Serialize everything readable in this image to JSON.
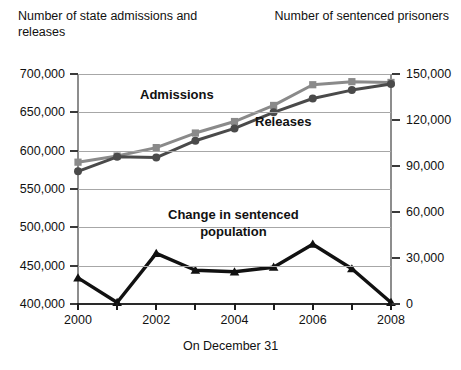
{
  "titles": {
    "left_axis": "Number of state admissions and releases",
    "right_axis": "Number of sentenced prisoners",
    "x_axis": "On December 31"
  },
  "labels": {
    "admissions": "Admissions",
    "releases": "Releases",
    "change_line1": "Change in sentenced",
    "change_line2": "population"
  },
  "colors": {
    "admissions": "#8a8a8a",
    "releases": "#4a4a4a",
    "change": "#111111",
    "gridline": "#a7a7a7",
    "axis": "#2a2a2a"
  },
  "chart_data": {
    "type": "line",
    "title": "",
    "xlabel": "On December 31",
    "ylabel": "Number of state admissions and releases",
    "y2label": "Number of sentenced prisoners",
    "x": [
      2000,
      2001,
      2002,
      2003,
      2004,
      2005,
      2006,
      2007,
      2008
    ],
    "xtick_labels": [
      "2000",
      "",
      "2002",
      "",
      "2004",
      "",
      "2006",
      "",
      "2008"
    ],
    "xlim": [
      2000,
      2008
    ],
    "ylim": [
      400000,
      700000
    ],
    "yticks": [
      400000,
      450000,
      500000,
      550000,
      600000,
      650000,
      700000
    ],
    "ytick_labels": [
      "400,000",
      "450,000",
      "500,000",
      "550,000",
      "600,000",
      "650,000",
      "700,000"
    ],
    "y2lim": [
      0,
      150000
    ],
    "y2ticks": [
      0,
      30000,
      60000,
      90000,
      120000,
      150000
    ],
    "y2tick_labels": [
      "0",
      "30,000",
      "60,000",
      "90,000",
      "120,000",
      "150,000"
    ],
    "grid": true,
    "legend": "inline-annotations",
    "series": [
      {
        "name": "Admissions",
        "axis": "left",
        "marker": "square",
        "color": "#8a8a8a",
        "values": [
          585000,
          593000,
          604000,
          623000,
          638000,
          659000,
          686000,
          690000,
          689000
        ]
      },
      {
        "name": "Releases",
        "axis": "left",
        "marker": "circle",
        "color": "#4a4a4a",
        "values": [
          573000,
          592000,
          591000,
          613000,
          629000,
          650000,
          668000,
          679000,
          687000
        ]
      },
      {
        "name": "Change in sentenced population",
        "axis": "right",
        "marker": "triangle",
        "color": "#111111",
        "values": [
          17000,
          1000,
          33000,
          22000,
          21000,
          24000,
          39000,
          23000,
          1000
        ]
      }
    ]
  }
}
